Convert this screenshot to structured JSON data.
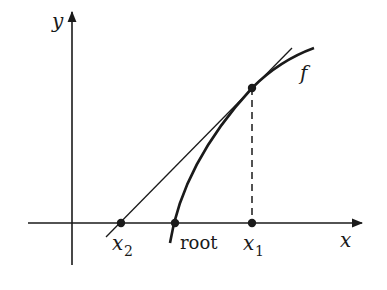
{
  "diagram": {
    "axes": {
      "x_label": "x",
      "y_label": "y"
    },
    "curve_label": "f",
    "points": [
      {
        "id": "x2",
        "label": "x",
        "subscript": "2"
      },
      {
        "id": "root",
        "label": "root",
        "subscript": ""
      },
      {
        "id": "x1",
        "label": "x",
        "subscript": "1"
      }
    ],
    "colors": {
      "ink": "#1a1a1a",
      "background": "#ffffff"
    }
  }
}
